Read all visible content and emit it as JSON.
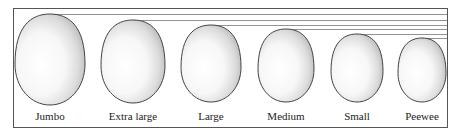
{
  "diagram": {
    "colors": {
      "border": "#555555",
      "egg_outline": "#444444",
      "egg_fill": "#ffffff",
      "egg_shade": "#c8c8c8",
      "guide_line": "#777777"
    },
    "eggs": [
      {
        "label": "Jumbo",
        "cx": 50,
        "top": 14,
        "bottom": 105,
        "rx": 35
      },
      {
        "label": "Extra large",
        "cx": 133,
        "top": 20,
        "bottom": 103,
        "rx": 32
      },
      {
        "label": "Large",
        "cx": 211,
        "top": 25,
        "bottom": 102,
        "rx": 30
      },
      {
        "label": "Medium",
        "cx": 286,
        "top": 29,
        "bottom": 102,
        "rx": 28
      },
      {
        "label": "Small",
        "cx": 357,
        "top": 34,
        "bottom": 102,
        "rx": 26
      },
      {
        "label": "Peewee",
        "cx": 422,
        "top": 38,
        "bottom": 102,
        "rx": 24
      }
    ]
  }
}
